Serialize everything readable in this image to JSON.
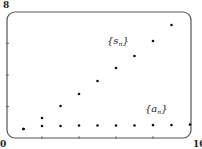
{
  "chart_data": {
    "type": "scatter",
    "title": "",
    "xlabel": "",
    "ylabel": "",
    "xlim": [
      0,
      10
    ],
    "ylim": [
      0,
      8
    ],
    "x_tick_labels": [
      "0",
      "10"
    ],
    "y_tick_labels": [
      "0",
      "8"
    ],
    "x_ticks": [
      2,
      4,
      6,
      8
    ],
    "y_ticks": [
      2,
      4,
      6
    ],
    "grid": false,
    "frame": "rounded box",
    "series": [
      {
        "name": "{s_n}",
        "label_main": "{s",
        "label_sub": "n",
        "label_close": "}",
        "x": [
          1,
          2,
          3,
          4,
          5,
          6,
          7,
          8,
          9
        ],
        "values": [
          0.57,
          1.27,
          2.03,
          2.79,
          3.62,
          4.44,
          5.21,
          6.16,
          7.17
        ]
      },
      {
        "name": "{a_n}",
        "label_main": "{a",
        "label_sub": "n",
        "label_close": "}",
        "x": [
          1,
          2,
          3,
          4,
          5,
          6,
          7,
          8,
          9,
          10
        ],
        "values": [
          0.57,
          0.76,
          0.76,
          0.79,
          0.79,
          0.79,
          0.79,
          0.82,
          0.82,
          0.85
        ]
      }
    ]
  },
  "labels": {
    "y_max": "8",
    "origin": "0",
    "x_max": "10"
  },
  "colors": {
    "frame": "#555555",
    "point": "#111111",
    "text": "#222222"
  }
}
